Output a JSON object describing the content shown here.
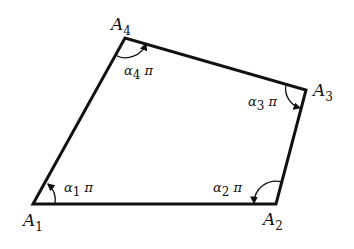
{
  "diagram": {
    "type": "quadrilateral",
    "vertices": [
      {
        "id": "A1",
        "name": "A",
        "sub": "1",
        "x": 33,
        "y": 204
      },
      {
        "id": "A2",
        "name": "A",
        "sub": "2",
        "x": 276,
        "y": 204
      },
      {
        "id": "A3",
        "name": "A",
        "sub": "3",
        "x": 306,
        "y": 90
      },
      {
        "id": "A4",
        "name": "A",
        "sub": "4",
        "x": 125,
        "y": 38
      }
    ],
    "angles": [
      {
        "vertex": "A1",
        "sym": "α",
        "sub": "1",
        "tail": " π"
      },
      {
        "vertex": "A2",
        "sym": "α",
        "sub": "2",
        "tail": " π"
      },
      {
        "vertex": "A3",
        "sym": "α",
        "sub": "3",
        "tail": " π"
      },
      {
        "vertex": "A4",
        "sym": "α",
        "sub": "4",
        "tail": " π"
      }
    ],
    "stroke_color": "#111111"
  }
}
